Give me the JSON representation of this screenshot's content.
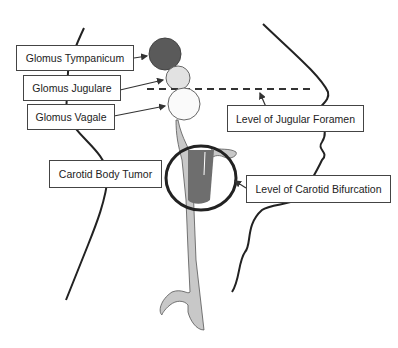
{
  "diagram": {
    "type": "anatomical schematic",
    "colors": {
      "glomus_tympanicum": "#5a5a5a",
      "glomus_jugulare": "#e2e2e2",
      "glomus_vagale": "#fafafa",
      "vessel": "#c8c8c8",
      "tumor": "#6e6e6e",
      "outline": "#222222"
    },
    "labels": {
      "glomus_tympanicum": "Glomus Tympanicum",
      "glomus_jugulare": "Glomus Jugulare",
      "glomus_vagale": "Glomus Vagale",
      "carotid_body_tumor": "Carotid Body Tumor",
      "jugular_foramen": "Level of Jugular Foramen",
      "carotid_bifurcation": "Level of Carotid Bifurcation"
    }
  }
}
